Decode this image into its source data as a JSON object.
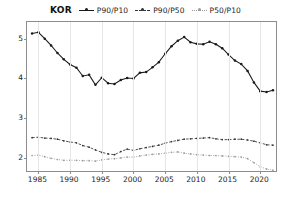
{
  "legend": {
    "title": "KOR",
    "entries": [
      {
        "label": "P90/P10",
        "color": "#1a1a1a",
        "dash": "solid"
      },
      {
        "label": "P90/P50",
        "color": "#333333",
        "dash": "dashed"
      },
      {
        "label": "P50/P10",
        "color": "#9a9a9a",
        "dash": "dotted"
      }
    ]
  },
  "axes": {
    "y_ticks": [
      "2",
      "3",
      "4",
      "5"
    ],
    "x_ticks": [
      "1985",
      "1990",
      "1995",
      "2000",
      "2005",
      "2010",
      "2015",
      "2020"
    ]
  },
  "chart_data": {
    "type": "line",
    "title": "KOR",
    "xlabel": "",
    "ylabel": "",
    "xlim": [
      1983.2,
      2022.8
    ],
    "ylim": [
      1.62,
      5.42
    ],
    "grid": "vertical",
    "legend_position": "top-center",
    "x": [
      1984,
      1985,
      1986,
      1987,
      1988,
      1989,
      1990,
      1991,
      1992,
      1993,
      1994,
      1995,
      1996,
      1997,
      1998,
      1999,
      2000,
      2001,
      2002,
      2003,
      2004,
      2005,
      2006,
      2007,
      2008,
      2009,
      2010,
      2011,
      2012,
      2013,
      2014,
      2015,
      2016,
      2017,
      2018,
      2019,
      2020,
      2021,
      2022
    ],
    "series": [
      {
        "name": "P90/P10",
        "color": "#1a1a1a",
        "dash": "solid",
        "values": [
          5.13,
          5.16,
          5.0,
          4.83,
          4.64,
          4.48,
          4.35,
          4.27,
          4.06,
          4.09,
          3.84,
          4.02,
          3.88,
          3.86,
          3.96,
          4.01,
          4.0,
          4.14,
          4.16,
          4.28,
          4.41,
          4.62,
          4.81,
          4.95,
          5.04,
          4.91,
          4.87,
          4.86,
          4.92,
          4.86,
          4.76,
          4.6,
          4.45,
          4.36,
          4.19,
          3.9,
          3.68,
          3.66,
          3.7
        ]
      },
      {
        "name": "P90/P50",
        "color": "#333333",
        "dash": "dashed",
        "values": [
          2.51,
          2.52,
          2.5,
          2.49,
          2.47,
          2.43,
          2.4,
          2.38,
          2.31,
          2.27,
          2.2,
          2.14,
          2.1,
          2.08,
          2.16,
          2.22,
          2.19,
          2.23,
          2.26,
          2.29,
          2.32,
          2.37,
          2.41,
          2.44,
          2.47,
          2.48,
          2.49,
          2.5,
          2.51,
          2.48,
          2.46,
          2.46,
          2.47,
          2.47,
          2.45,
          2.42,
          2.38,
          2.33,
          2.32
        ]
      },
      {
        "name": "P50/P10",
        "color": "#9a9a9a",
        "dash": "dotted",
        "values": [
          2.06,
          2.07,
          2.03,
          1.99,
          1.96,
          1.94,
          1.94,
          1.94,
          1.93,
          1.93,
          1.92,
          1.95,
          1.97,
          1.98,
          2.0,
          2.02,
          2.02,
          2.05,
          2.07,
          2.09,
          2.1,
          2.12,
          2.14,
          2.15,
          2.12,
          2.1,
          2.08,
          2.07,
          2.06,
          2.06,
          2.05,
          2.04,
          2.03,
          2.02,
          1.98,
          1.88,
          1.78,
          1.72,
          1.69
        ]
      }
    ]
  }
}
